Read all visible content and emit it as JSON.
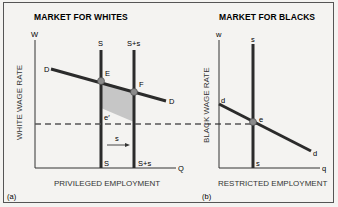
{
  "panel_a": {
    "title": "MARKET FOR WHITES",
    "y_axis_symbol": "W",
    "x_axis_symbol": "Q",
    "y_label": "WHITE WAGE RATE",
    "x_label": "PRIVILEGED EMPLOYMENT",
    "panel_tag": "(a)",
    "demand_label_left": "D",
    "demand_label_right": "D",
    "supply_label_top": "S",
    "supply_label_bottom": "S",
    "shifted_supply_label_top": "S+s",
    "shifted_supply_label_bottom": "S+s",
    "point_E": "E",
    "point_F": "F",
    "point_e_prime": "e′",
    "shift_arrow_label": "s"
  },
  "panel_b": {
    "title": "MARKET FOR BLACKS",
    "y_axis_symbol": "w",
    "x_axis_symbol": "q",
    "y_label": "BLACK WAGE RATE",
    "x_label": "RESTRICTED EMPLOYMENT",
    "panel_tag": "(b)",
    "demand_label_left": "d",
    "demand_label_right": "d",
    "supply_label_top": "s",
    "supply_label_bottom": "s",
    "point_e": "e"
  },
  "colors": {
    "line": "#2b2b2b",
    "point": "#8a8a8a",
    "shade": "#c8c8c8",
    "dashed": "#555555"
  }
}
